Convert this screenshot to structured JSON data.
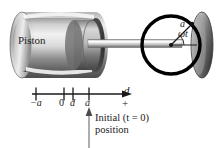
{
  "figure": {
    "background_color": "#ffffff",
    "ink_color": "#1a1a1a"
  },
  "machine": {
    "piston_label": "Piston",
    "cylinder_fill_light": "#e8e8e8",
    "cylinder_fill_dark": "#6f6f6f",
    "rod_fill": "#dcdcdc",
    "flywheel_fill": "#8a8a8a"
  },
  "crank": {
    "circle_stroke": "#000000",
    "radius_label": "a",
    "angle_label": "ωt",
    "center_dot_color": "#111111"
  },
  "axis": {
    "arrow_label": "d",
    "sign_label": "+",
    "ticks": [
      {
        "label": "−a",
        "value": -1
      },
      {
        "label": "0",
        "value": 0
      },
      {
        "label": "d",
        "value": 0.25
      },
      {
        "label": "a",
        "value": 1
      }
    ]
  },
  "caption": {
    "line1": "Initial (t = 0)",
    "line2": "position"
  },
  "icons": {
    "axis_arrow": "arrow-right-icon",
    "pointer_arrow": "arrow-up-icon"
  }
}
